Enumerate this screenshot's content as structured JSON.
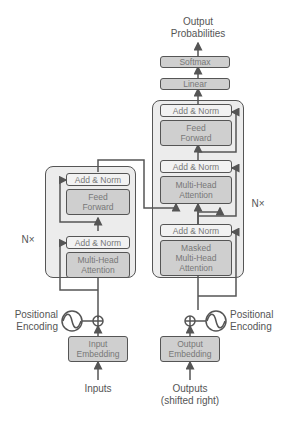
{
  "diagram": {
    "output": {
      "line1": "Output",
      "line2": "Probabilities"
    },
    "softmax": "Softmax",
    "linear": "Linear",
    "encoder": {
      "repeat": "N×",
      "add_norm_top": "Add & Norm",
      "feed_forward": {
        "line1": "Feed",
        "line2": "Forward"
      },
      "add_norm_bottom": "Add & Norm",
      "attention": {
        "line1": "Multi-Head",
        "line2": "Attention"
      },
      "positional": {
        "line1": "Positional",
        "line2": "Encoding"
      },
      "embedding": {
        "line1": "Input",
        "line2": "Embedding"
      },
      "input_label": "Inputs"
    },
    "decoder": {
      "repeat": "N×",
      "add_norm_top": "Add & Norm",
      "feed_forward": {
        "line1": "Feed",
        "line2": "Forward"
      },
      "add_norm_mid": "Add & Norm",
      "cross_attention": {
        "line1": "Multi-Head",
        "line2": "Attention"
      },
      "add_norm_bottom": "Add & Norm",
      "masked_attention": {
        "line1": "Masked",
        "line2": "Multi-Head",
        "line3": "Attention"
      },
      "positional": {
        "line1": "Positional",
        "line2": "Encoding"
      },
      "embedding": {
        "line1": "Output",
        "line2": "Embedding"
      },
      "input_label": {
        "line1": "Outputs",
        "line2": "(shifted right)"
      }
    },
    "colors": {
      "stroke": "#555555",
      "box_fill": "#cfcfcf",
      "norm_fill": "#f2f2f2",
      "block_fill": "#ececec"
    }
  }
}
